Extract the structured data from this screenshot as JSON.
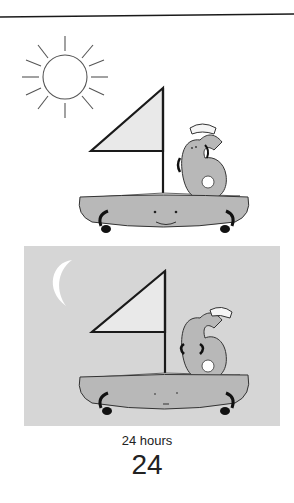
{
  "illustration": {
    "day_panel": {
      "description": "Day scene: sun over a sailboat with a smiling face, number 6 wearing a sailor hat aboard",
      "icons": [
        "sun-icon",
        "sailboat-icon",
        "number-six-character"
      ]
    },
    "night_panel": {
      "description": "Night scene: crescent moon over a sleeping sailboat with number 6 wearing a sailor hat aboard",
      "icons": [
        "moon-icon",
        "sailboat-icon",
        "number-six-character"
      ],
      "background": "#d6d6d6"
    }
  },
  "caption": {
    "label": "24 hours",
    "number": "24"
  },
  "colors": {
    "boat_fill": "#b8b8b8",
    "sail_fill": "#e9e9e9",
    "outline": "#1a1a1a",
    "night_bg": "#d6d6d6",
    "moon": "#ffffff"
  }
}
